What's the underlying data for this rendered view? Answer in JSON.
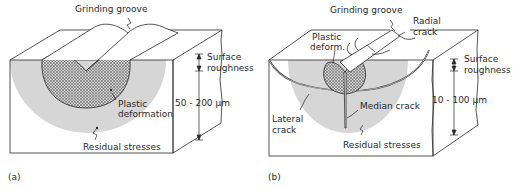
{
  "figure_a": {
    "caption": "(a)",
    "labels": {
      "grinding_groove": "Grinding groove",
      "surface_roughness_1": "Surface",
      "surface_roughness_2": "roughness",
      "depth": "50 - 200 µm",
      "plastic_deformation_1": "Plastic",
      "plastic_deformation_2": "deformation",
      "residual_stresses": "Residual stresses"
    }
  },
  "figure_b": {
    "caption": "(b)",
    "labels": {
      "grinding_groove": "Grinding groove",
      "radial_crack_1": "Radial",
      "radial_crack_2": "crack",
      "plastic_deform_1": "Plastic",
      "plastic_deform_2": "deform.",
      "surface_roughness_1": "Surface",
      "surface_roughness_2": "roughness",
      "depth": "10 - 100 µm",
      "lateral_crack_1": "Lateral",
      "lateral_crack_2": "crack",
      "median_crack": "Median crack",
      "residual_stresses": "Residual stresses"
    }
  },
  "colors": {
    "line": "#2a2a2a",
    "residual_fill": "#d4d4d4",
    "plastic_fill": "#9a9a9a"
  }
}
